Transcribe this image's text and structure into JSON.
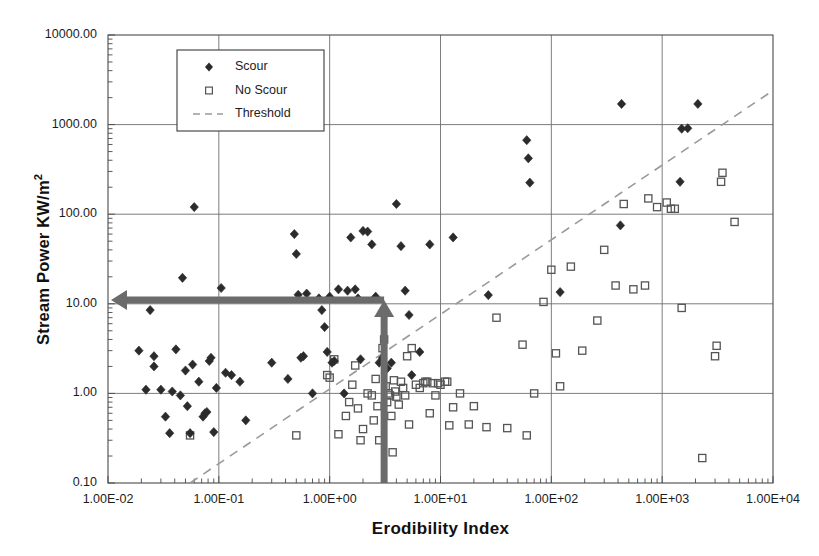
{
  "chart_data": {
    "type": "scatter",
    "title": "",
    "xlabel": "Erodibility Index",
    "ylabel": "Stream Power KW/m2",
    "ylabel_base": "Stream Power KW/m",
    "ylabel_exponent": "2",
    "xscale": "log",
    "yscale": "log",
    "xlim": [
      0.01,
      10000
    ],
    "ylim": [
      0.1,
      10000
    ],
    "grid": true,
    "legend_position": "top-left-inside",
    "xticklabels": [
      "1.00E-02",
      "1.00E-01",
      "1.00E+00",
      "1.00E+01",
      "1.00E+02",
      "1.00E+03",
      "1.00E+04"
    ],
    "xtickvalues": [
      0.01,
      0.1,
      1,
      10,
      100,
      1000,
      10000
    ],
    "yticklabels": [
      "0.10",
      "1.00",
      "10.00",
      "100.00",
      "1000.00",
      "10000.00"
    ],
    "ytickvalues": [
      0.1,
      1,
      10,
      100,
      1000,
      10000
    ],
    "legend": [
      {
        "label": "Scour",
        "marker": "filled-diamond",
        "color": "#2b2b2b"
      },
      {
        "label": "No Scour",
        "marker": "open-square",
        "color": "#555555"
      },
      {
        "label": "Threshold",
        "marker": "dashed-line",
        "color": "#9a9a9a"
      }
    ],
    "series": [
      {
        "name": "Scour",
        "marker": "filled-diamond",
        "color": "#2b2b2b",
        "points": [
          [
            0.019,
            3.0
          ],
          [
            0.022,
            1.1
          ],
          [
            0.024,
            8.5
          ],
          [
            0.026,
            2.0
          ],
          [
            0.026,
            2.6
          ],
          [
            0.03,
            1.1
          ],
          [
            0.033,
            0.55
          ],
          [
            0.036,
            0.36
          ],
          [
            0.038,
            1.05
          ],
          [
            0.041,
            3.1
          ],
          [
            0.045,
            0.95
          ],
          [
            0.047,
            19.5
          ],
          [
            0.05,
            1.8
          ],
          [
            0.052,
            0.72
          ],
          [
            0.055,
            0.36
          ],
          [
            0.058,
            2.1
          ],
          [
            0.06,
            120.0
          ],
          [
            0.066,
            1.35
          ],
          [
            0.072,
            0.55
          ],
          [
            0.075,
            0.6
          ],
          [
            0.078,
            0.62
          ],
          [
            0.082,
            2.3
          ],
          [
            0.085,
            2.5
          ],
          [
            0.09,
            0.37
          ],
          [
            0.095,
            1.15
          ],
          [
            0.105,
            15.0
          ],
          [
            0.115,
            1.7
          ],
          [
            0.13,
            1.6
          ],
          [
            0.155,
            1.35
          ],
          [
            0.175,
            0.5
          ],
          [
            0.3,
            2.2
          ],
          [
            0.42,
            1.45
          ],
          [
            0.48,
            60.0
          ],
          [
            0.5,
            36.0
          ],
          [
            0.52,
            12.6
          ],
          [
            0.55,
            2.5
          ],
          [
            0.58,
            2.6
          ],
          [
            0.62,
            13.0
          ],
          [
            0.7,
            1.0
          ],
          [
            0.8,
            11.5
          ],
          [
            0.85,
            8.5
          ],
          [
            0.9,
            5.5
          ],
          [
            0.95,
            2.9
          ],
          [
            1.0,
            12.0
          ],
          [
            1.05,
            2.2
          ],
          [
            1.1,
            2.3
          ],
          [
            1.2,
            14.5
          ],
          [
            1.35,
            1.0
          ],
          [
            1.45,
            14.0
          ],
          [
            1.55,
            55.0
          ],
          [
            1.7,
            14.5
          ],
          [
            1.8,
            11.5
          ],
          [
            1.9,
            2.4
          ],
          [
            2.0,
            65.0
          ],
          [
            2.2,
            64.0
          ],
          [
            2.4,
            46.0
          ],
          [
            2.6,
            12.0
          ],
          [
            2.8,
            2.2
          ],
          [
            3.0,
            2.5
          ],
          [
            3.3,
            1.9
          ],
          [
            3.6,
            2.2
          ],
          [
            4.0,
            130.0
          ],
          [
            4.4,
            44.0
          ],
          [
            4.8,
            14.0
          ],
          [
            5.2,
            7.5
          ],
          [
            5.5,
            1.6
          ],
          [
            6.5,
            2.9
          ],
          [
            8.0,
            46.0
          ],
          [
            13.0,
            55.0
          ],
          [
            27.0,
            12.5
          ],
          [
            60.0,
            670.0
          ],
          [
            62.0,
            420.0
          ],
          [
            64.0,
            225.0
          ],
          [
            120.0,
            13.5
          ],
          [
            420.0,
            75.0
          ],
          [
            430.0,
            1700.0
          ],
          [
            1450.0,
            230.0
          ],
          [
            1500.0,
            900.0
          ],
          [
            1700.0,
            910.0
          ],
          [
            2100.0,
            1700.0
          ]
        ]
      },
      {
        "name": "No Scour",
        "marker": "open-square",
        "color": "#555555",
        "points": [
          [
            0.055,
            0.34
          ],
          [
            0.5,
            0.34
          ],
          [
            0.95,
            1.6
          ],
          [
            1.0,
            1.5
          ],
          [
            1.1,
            2.4
          ],
          [
            1.2,
            0.35
          ],
          [
            1.4,
            0.56
          ],
          [
            1.5,
            0.8
          ],
          [
            1.6,
            1.25
          ],
          [
            1.7,
            2.05
          ],
          [
            1.8,
            0.68
          ],
          [
            1.9,
            0.3
          ],
          [
            2.0,
            0.4
          ],
          [
            2.2,
            1.0
          ],
          [
            2.4,
            0.95
          ],
          [
            2.5,
            0.5
          ],
          [
            2.6,
            1.45
          ],
          [
            2.7,
            0.72
          ],
          [
            2.8,
            0.3
          ],
          [
            3.0,
            3.2
          ],
          [
            3.1,
            4.0
          ],
          [
            3.2,
            1.2
          ],
          [
            3.3,
            0.8
          ],
          [
            3.4,
            1.0
          ],
          [
            3.5,
            0.95
          ],
          [
            3.6,
            0.56
          ],
          [
            3.7,
            0.22
          ],
          [
            3.8,
            1.4
          ],
          [
            3.9,
            1.05
          ],
          [
            4.0,
            0.92
          ],
          [
            4.2,
            0.75
          ],
          [
            4.4,
            1.35
          ],
          [
            4.6,
            1.15
          ],
          [
            4.8,
            0.95
          ],
          [
            5.0,
            2.6
          ],
          [
            5.2,
            0.45
          ],
          [
            5.5,
            3.2
          ],
          [
            6.0,
            1.25
          ],
          [
            6.5,
            1.15
          ],
          [
            7.0,
            1.3
          ],
          [
            7.3,
            1.35
          ],
          [
            7.6,
            1.35
          ],
          [
            8.0,
            0.6
          ],
          [
            8.5,
            1.3
          ],
          [
            9.0,
            0.95
          ],
          [
            9.5,
            1.3
          ],
          [
            10.0,
            1.25
          ],
          [
            11.0,
            1.35
          ],
          [
            11.5,
            1.35
          ],
          [
            12.0,
            0.44
          ],
          [
            13.0,
            0.7
          ],
          [
            15.0,
            1.0
          ],
          [
            18.0,
            0.45
          ],
          [
            20.0,
            0.72
          ],
          [
            26.0,
            0.42
          ],
          [
            32.0,
            7.0
          ],
          [
            40.0,
            0.41
          ],
          [
            55.0,
            3.5
          ],
          [
            60.0,
            0.34
          ],
          [
            70.0,
            1.0
          ],
          [
            85.0,
            10.5
          ],
          [
            100.0,
            24.0
          ],
          [
            110.0,
            2.8
          ],
          [
            120.0,
            1.2
          ],
          [
            150.0,
            26.0
          ],
          [
            190.0,
            3.0
          ],
          [
            260.0,
            6.5
          ],
          [
            300.0,
            40.0
          ],
          [
            380.0,
            16.0
          ],
          [
            450.0,
            130.0
          ],
          [
            550.0,
            14.5
          ],
          [
            700.0,
            16.0
          ],
          [
            750.0,
            150.0
          ],
          [
            900.0,
            120.0
          ],
          [
            1100.0,
            135.0
          ],
          [
            1200.0,
            115.0
          ],
          [
            1300.0,
            115.0
          ],
          [
            1500.0,
            9.0
          ],
          [
            2300.0,
            0.19
          ],
          [
            3000.0,
            2.6
          ],
          [
            3100.0,
            3.4
          ],
          [
            3400.0,
            230.0
          ],
          [
            3500.0,
            290.0
          ],
          [
            4500.0,
            82.0
          ]
        ]
      }
    ],
    "threshold_line": {
      "name": "Threshold",
      "style": "dashed",
      "color": "#9a9a9a",
      "x0": 0.055,
      "y0": 0.1,
      "x1": 10000,
      "y1": 2400
    },
    "annotations": [
      {
        "name": "vertical-arrow",
        "direction": "up",
        "color": "#6b6b6b",
        "x": 3.1,
        "y_from": 0.1,
        "y_to": 11.0
      },
      {
        "name": "horizontal-arrow",
        "direction": "left",
        "color": "#6b6b6b",
        "y": 11.0,
        "x_from": 3.1,
        "x_to": 0.01
      }
    ]
  }
}
